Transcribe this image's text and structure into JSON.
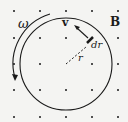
{
  "diagram": {
    "labels": {
      "field": "B",
      "angular_velocity": "ω",
      "velocity": "v",
      "element": "dr",
      "radius": "r"
    },
    "colors": {
      "ink": "#1a1a1a",
      "background": "#f4f4f2"
    },
    "field_direction": "out-of-page (dot grid)",
    "rotation": "counterclockwise arrow on left side"
  }
}
